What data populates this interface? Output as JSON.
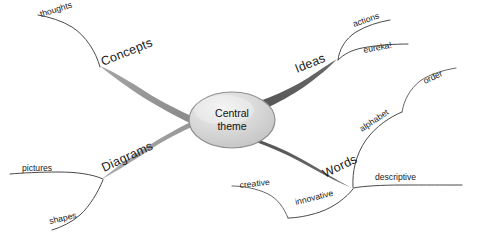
{
  "diagram": {
    "type": "mind-map",
    "background_color": "#ffffff",
    "center": {
      "label_line1": "Central",
      "label_line2": "theme",
      "shape": "ellipse",
      "fill_color": "#d2d2d2",
      "highlight_color": "#eaeaea",
      "border_color": "#8f8f8f",
      "cx": 232,
      "cy": 120,
      "rx": 43,
      "ry": 28
    },
    "branches": [
      {
        "id": "concepts",
        "label": "Concepts",
        "position": "upper-left",
        "color": "#8d8d8d",
        "label_x": 103,
        "label_y": 66,
        "label_rotate": -22,
        "children": [
          {
            "id": "thoughts",
            "label": "thoughts",
            "label_x": 41,
            "label_y": 17,
            "label_rotate": -17
          }
        ]
      },
      {
        "id": "ideas",
        "label": "Ideas",
        "position": "upper-right",
        "color": "#585858",
        "label_x": 297,
        "label_y": 73,
        "label_rotate": -22,
        "children": [
          {
            "id": "actions",
            "label": "actions",
            "label_x": 354,
            "label_y": 27,
            "label_rotate": -19
          },
          {
            "id": "eureka",
            "label": "eureka!",
            "label_x": 364,
            "label_y": 53,
            "label_rotate": -11
          }
        ]
      },
      {
        "id": "diagrams",
        "label": "Diagrams",
        "position": "lower-left",
        "color": "#9a9a9a",
        "label_x": 104,
        "label_y": 172,
        "label_rotate": -25,
        "children": [
          {
            "id": "pictures",
            "label": "pictures",
            "label_x": 22,
            "label_y": 171,
            "label_rotate": 0
          },
          {
            "id": "shapes",
            "label": "shapes",
            "label_x": 50,
            "label_y": 224,
            "label_rotate": -13
          }
        ]
      },
      {
        "id": "words",
        "label": "Words",
        "position": "lower-right",
        "color": "#585858",
        "label_x": 325,
        "label_y": 178,
        "label_rotate": -26,
        "children": [
          {
            "id": "descriptive",
            "label": "descriptive",
            "label_x": 375,
            "label_y": 180,
            "label_rotate": 0
          },
          {
            "id": "innovative",
            "label": "innovative",
            "label_x": 296,
            "label_y": 205,
            "label_rotate": -14
          },
          {
            "id": "creative",
            "label": "creative",
            "label_x": 240,
            "label_y": 188,
            "label_rotate": -6
          },
          {
            "id": "alphabet",
            "label": "alphabet",
            "label_x": 362,
            "label_y": 132,
            "label_rotate": -34
          },
          {
            "id": "order",
            "label": "order",
            "label_x": 425,
            "label_y": 84,
            "label_rotate": -25
          }
        ]
      }
    ]
  }
}
